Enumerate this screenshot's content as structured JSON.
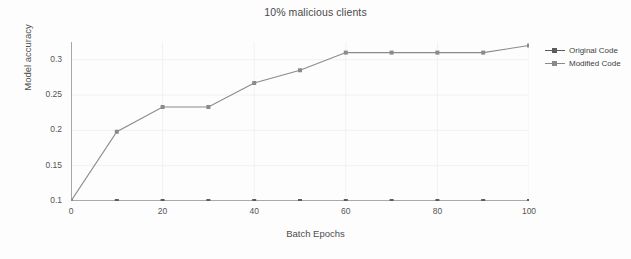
{
  "chart_data": {
    "type": "line",
    "title": "10% malicious clients",
    "xlabel": "Batch Epochs",
    "ylabel": "Model accuracy",
    "x": [
      0,
      10,
      20,
      30,
      40,
      50,
      60,
      70,
      80,
      90,
      100
    ],
    "series": [
      {
        "name": "Original Code",
        "color": "#5c5c5c",
        "values": [
          0.1,
          0.1,
          0.1,
          0.1,
          0.1,
          0.1,
          0.1,
          0.1,
          0.1,
          0.1,
          0.1
        ]
      },
      {
        "name": "Modified Code",
        "color": "#8a8a8a",
        "values": [
          0.1,
          0.198,
          0.233,
          0.233,
          0.267,
          0.285,
          0.31,
          0.31,
          0.31,
          0.31,
          0.32
        ]
      }
    ],
    "xticks": [
      0,
      20,
      40,
      60,
      80,
      100
    ],
    "xtick_labels": [
      "0",
      "20",
      "40",
      "60",
      "80",
      "100"
    ],
    "yticks": [
      0.1,
      0.15,
      0.2,
      0.25,
      0.3
    ],
    "ytick_labels": [
      "0.1",
      "0.15",
      "0.2",
      "0.25",
      "0.3"
    ],
    "xlim": [
      0,
      100
    ],
    "ylim": [
      0.1,
      0.325
    ],
    "grid": true,
    "grid_color": "#f1f1f1",
    "legend_position": "right",
    "background": "#fdfdfd"
  },
  "legend": {
    "entries": [
      {
        "label": "Original Code"
      },
      {
        "label": "Modified Code"
      }
    ]
  }
}
